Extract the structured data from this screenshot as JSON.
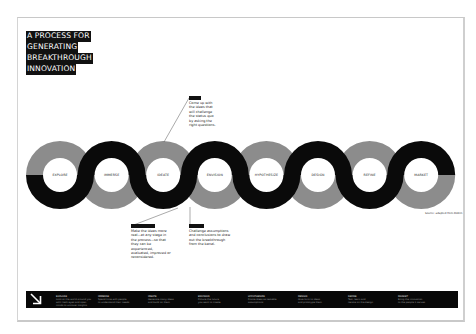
{
  "title": {
    "lines": [
      "A PROCESS FOR",
      "GENERATING",
      "BREAKTHROUGH",
      "INNOVATION"
    ]
  },
  "colors": {
    "black": "#0a0a0a",
    "gray": "#8c8c8c",
    "background": "#ffffff",
    "footer": "#080808"
  },
  "stages": [
    {
      "label": "EXPLORE",
      "black_half": "bottom"
    },
    {
      "label": "IMMERSE",
      "black_half": "top"
    },
    {
      "label": "IDEATE",
      "black_half": "bottom"
    },
    {
      "label": "ENVISION",
      "black_half": "top"
    },
    {
      "label": "HYPOTHESIZE",
      "black_half": "bottom"
    },
    {
      "label": "DESIGN",
      "black_half": "top"
    },
    {
      "label": "REFINE",
      "black_half": "bottom"
    },
    {
      "label": "MARKET",
      "black_half": "top"
    }
  ],
  "callouts": [
    {
      "tag": "IDEATE",
      "text": "Come up with the ideas that will challenge the status quo by asking the right questions.",
      "points_to": "IDEATE"
    },
    {
      "tag": "IMMERSE",
      "text": "Make the ideas more real—at any stage in the process—so that they can be experienced, evaluated, improved or reconsidered.",
      "points_to": "IDEATE"
    },
    {
      "tag": "ENVISION",
      "text": "Challenge assumptions and conclusions to draw out the breakthrough from the banal.",
      "points_to": "ENVISION"
    }
  ],
  "credit": "Source: adapted from Doblin",
  "footer": {
    "icon": "arrow-down-right-icon",
    "columns": [
      {
        "heading": "EXPLORE",
        "lines": [
          "Look at the world around you",
          "with fresh eyes and open",
          "minds to uncover insights"
        ]
      },
      {
        "heading": "IMMERSE",
        "lines": [
          "Spend time with people",
          "to understand their needs"
        ]
      },
      {
        "heading": "IDEATE",
        "lines": [
          "Generate many ideas",
          "and build on them"
        ]
      },
      {
        "heading": "ENVISION",
        "lines": [
          "Picture the future",
          "you want to create"
        ]
      },
      {
        "heading": "HYPOTHESIZE",
        "lines": [
          "Frame ideas as testable",
          "assumptions"
        ]
      },
      {
        "heading": "DESIGN",
        "lines": [
          "Give form to ideas",
          "and prototype them"
        ]
      },
      {
        "heading": "REFINE",
        "lines": [
          "Test, learn and",
          "iterate on the design"
        ]
      },
      {
        "heading": "MARKET",
        "lines": [
          "Bring the innovation",
          "to the people it serves"
        ]
      }
    ]
  }
}
